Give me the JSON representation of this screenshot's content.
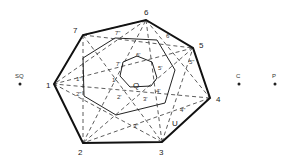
{
  "diagram": {
    "outer_vertices": [
      {
        "label": "1",
        "x": 54,
        "y": 84,
        "lx": 46,
        "ly": 88
      },
      {
        "label": "2",
        "x": 83,
        "y": 143,
        "lx": 78,
        "ly": 154
      },
      {
        "label": "3",
        "x": 162,
        "y": 142,
        "lx": 160,
        "ly": 154
      },
      {
        "label": "4",
        "x": 210,
        "y": 98,
        "lx": 216,
        "ly": 102
      },
      {
        "label": "5",
        "x": 193,
        "y": 48,
        "lx": 199,
        "ly": 47
      },
      {
        "label": "6",
        "x": 146,
        "y": 20,
        "lx": 144,
        "ly": 15
      },
      {
        "label": "7",
        "x": 83,
        "y": 35,
        "lx": 74,
        "ly": 32
      }
    ],
    "middle_labels": [
      "1\"",
      "2\"",
      "3\"",
      "4\"",
      "5\"",
      "6\"",
      "7\""
    ],
    "inner_labels": [
      "1'",
      "2'",
      "3'",
      "4'",
      "5'",
      "6'",
      "7'"
    ],
    "center_label": "Q",
    "u_label": "U",
    "external_points": [
      {
        "label": "SQ",
        "x": 20,
        "y": 84
      },
      {
        "label": "C",
        "x": 239,
        "y": 84
      },
      {
        "label": "P",
        "x": 275,
        "y": 84
      }
    ],
    "stroke_color": "#222222"
  }
}
